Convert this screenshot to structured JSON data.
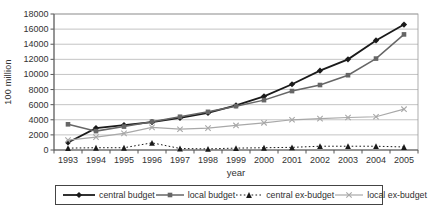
{
  "figure": {
    "background": "#ffffff",
    "border_color": "#999999",
    "grid_color": "#aaaaaa",
    "axis_color": "#555555",
    "text_color": "#333333"
  },
  "chart_data": {
    "type": "line",
    "title": "",
    "xlabel": "year",
    "ylabel": "100 million",
    "x": [
      1993,
      1994,
      1995,
      1996,
      1997,
      1998,
      1999,
      2000,
      2001,
      2002,
      2003,
      2004,
      2005
    ],
    "ylim": [
      0,
      18000
    ],
    "yticks": [
      0,
      2000,
      4000,
      6000,
      8000,
      10000,
      12000,
      14000,
      16000,
      18000
    ],
    "grid": true,
    "legend_position": "bottom",
    "series": [
      {
        "name": "central budget",
        "color": "#1a1a1a",
        "marker": "diamond",
        "line_style": "solid",
        "line_width": 1.8,
        "values": [
          1000,
          2900,
          3300,
          3700,
          4250,
          4900,
          5900,
          7100,
          8700,
          10500,
          12000,
          14500,
          16600
        ]
      },
      {
        "name": "local budget",
        "color": "#666666",
        "marker": "square",
        "line_style": "solid",
        "line_width": 1.5,
        "values": [
          3400,
          2500,
          3100,
          3750,
          4400,
          5050,
          5800,
          6600,
          7800,
          8600,
          9900,
          12100,
          15300
        ]
      },
      {
        "name": "central ex-budget",
        "color": "#1a1a1a",
        "marker": "triangle",
        "line_style": "dotted",
        "line_width": 1,
        "values": [
          250,
          300,
          300,
          950,
          200,
          150,
          250,
          300,
          350,
          500,
          500,
          500,
          400
        ]
      },
      {
        "name": "local ex-budget",
        "color": "#a8a8a8",
        "marker": "x",
        "line_style": "solid",
        "line_width": 1.2,
        "values": [
          1300,
          1700,
          2200,
          3000,
          2750,
          2900,
          3250,
          3600,
          4000,
          4150,
          4300,
          4400,
          5400
        ]
      }
    ]
  }
}
